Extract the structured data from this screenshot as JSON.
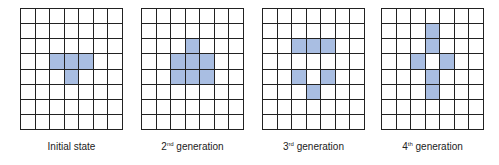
{
  "diagram": {
    "grid_cols": 7,
    "grid_rows": 8,
    "fill_color": "#a9bee2",
    "panels": [
      {
        "label_prefix": "Initial state",
        "label_sup": "",
        "label_suffix": "",
        "filled": [
          [
            3,
            2
          ],
          [
            3,
            3
          ],
          [
            3,
            4
          ],
          [
            4,
            3
          ]
        ]
      },
      {
        "label_prefix": "2",
        "label_sup": "nd",
        "label_suffix": " generation",
        "filled": [
          [
            2,
            3
          ],
          [
            3,
            2
          ],
          [
            3,
            3
          ],
          [
            3,
            4
          ],
          [
            4,
            2
          ],
          [
            4,
            3
          ],
          [
            4,
            4
          ]
        ]
      },
      {
        "label_prefix": "3",
        "label_sup": "rd",
        "label_suffix": " generation",
        "filled": [
          [
            2,
            2
          ],
          [
            2,
            3
          ],
          [
            2,
            4
          ],
          [
            4,
            2
          ],
          [
            4,
            4
          ],
          [
            5,
            3
          ]
        ]
      },
      {
        "label_prefix": "4",
        "label_sup": "th",
        "label_suffix": " generation",
        "filled": [
          [
            1,
            3
          ],
          [
            2,
            3
          ],
          [
            3,
            2
          ],
          [
            3,
            4
          ],
          [
            4,
            3
          ],
          [
            5,
            3
          ]
        ]
      }
    ]
  }
}
